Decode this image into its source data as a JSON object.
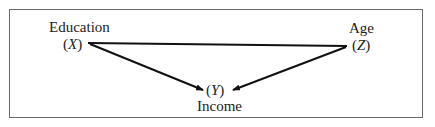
{
  "diagram": {
    "nodes": {
      "education": {
        "label": "Education",
        "symbol_open": "(",
        "symbol": "X",
        "symbol_close": ")"
      },
      "age": {
        "label": "Age",
        "symbol_open": "(",
        "symbol": "Z",
        "symbol_close": ")"
      },
      "income": {
        "label": "Income",
        "symbol_open": "(",
        "symbol": "Y",
        "symbol_close": ")"
      }
    },
    "edges": [
      {
        "from": "education",
        "to": "age",
        "type": "undirected"
      },
      {
        "from": "education",
        "to": "income",
        "type": "directed"
      },
      {
        "from": "age",
        "to": "income",
        "type": "directed"
      }
    ]
  }
}
